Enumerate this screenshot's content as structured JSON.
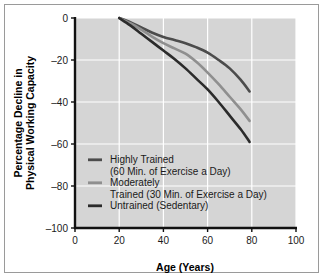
{
  "chart_data": {
    "type": "line",
    "title": "",
    "xlabel": "Age (Years)",
    "ylabel_line1": "Percentage Decline in",
    "ylabel_line2": "Physical Working Capacity",
    "xlim": [
      0,
      100
    ],
    "ylim": [
      -100,
      0
    ],
    "xticks": [
      "0",
      "20",
      "40",
      "60",
      "80",
      "100"
    ],
    "xtick_values": [
      0,
      20,
      40,
      60,
      80,
      100
    ],
    "yticks": [
      "0",
      "–20",
      "–40",
      "–60",
      "–80",
      "–100"
    ],
    "ytick_values": [
      0,
      -20,
      -40,
      -60,
      -80,
      -100
    ],
    "grid": true,
    "grid_color": "#ffffff",
    "plot_background": "#d5d5d5",
    "legend_position": "lower-left-inside",
    "series": [
      {
        "name": "Highly Trained",
        "legend_line1": "Highly Trained",
        "legend_line2": "(60 Min. of Exercise a Day)",
        "color": "#4c4c4c",
        "x": [
          20,
          25,
          30,
          35,
          40,
          45,
          50,
          55,
          60,
          65,
          70,
          75,
          79
        ],
        "y": [
          0,
          -2.0,
          -4.5,
          -7.0,
          -9.0,
          -10.5,
          -12.0,
          -14.0,
          -16.5,
          -20.0,
          -24.0,
          -29.5,
          -35.0
        ]
      },
      {
        "name": "Moderately Trained",
        "legend_line1": "Moderately",
        "legend_line2": "Trained (30 Min. of Exercise a Day)",
        "color": "#8f8f8f",
        "x": [
          20,
          25,
          30,
          35,
          40,
          45,
          50,
          55,
          60,
          65,
          70,
          75,
          79
        ],
        "y": [
          0,
          -2.5,
          -5.5,
          -9.0,
          -12.0,
          -14.5,
          -17.0,
          -21.0,
          -26.0,
          -31.5,
          -37.5,
          -43.5,
          -49.0
        ]
      },
      {
        "name": "Untrained (Sedentary)",
        "legend_line1": "Untrained (Sedentary)",
        "legend_line2": "",
        "color": "#2b2b2b",
        "x": [
          20,
          25,
          30,
          35,
          40,
          45,
          50,
          55,
          60,
          65,
          70,
          75,
          79
        ],
        "y": [
          0,
          -3.5,
          -7.5,
          -11.5,
          -15.5,
          -19.5,
          -24.0,
          -29.0,
          -34.0,
          -40.0,
          -46.5,
          -53.0,
          -59.0
        ]
      }
    ]
  }
}
